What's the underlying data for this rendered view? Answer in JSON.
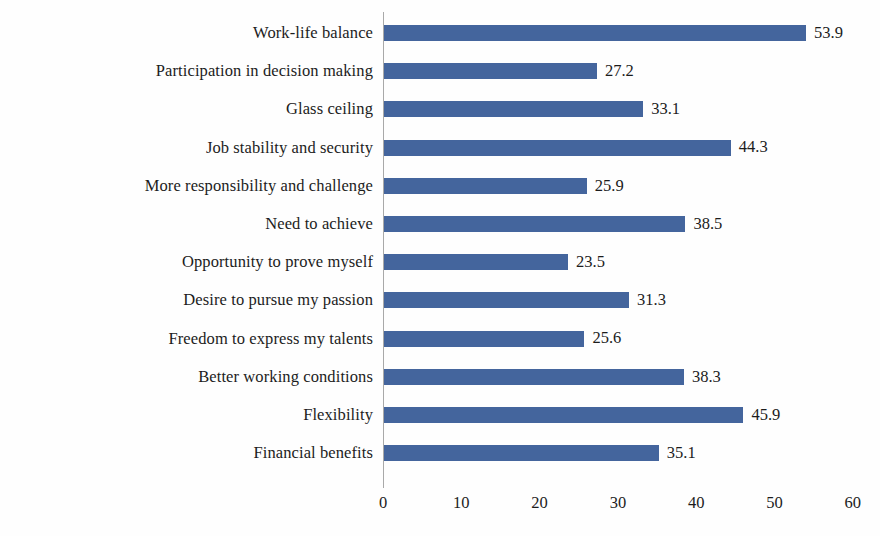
{
  "chart_data": {
    "type": "bar",
    "orientation": "horizontal",
    "title": "",
    "subtitle": "",
    "xlabel": "",
    "ylabel": "",
    "xlim": [
      0,
      60
    ],
    "xticks": [
      "0",
      "10",
      "20",
      "30",
      "40",
      "50",
      "60"
    ],
    "grid": false,
    "legend": false,
    "legend_position": "none",
    "bar_color": "#44659d",
    "axis_color": "#a9a9a9",
    "text_color": "#1c1c1c",
    "data_labels": true,
    "categories": [
      "Work-life balance",
      "Participation in decision making",
      "Glass ceiling",
      "Job stability and security",
      "More responsibility and challenge",
      "Need to achieve",
      "Opportunity to prove myself",
      "Desire to pursue my passion",
      "Freedom to express my talents",
      "Better working conditions",
      "Flexibility",
      "Financial benefits"
    ],
    "values": [
      53.9,
      27.2,
      33.1,
      44.3,
      25.9,
      38.5,
      23.5,
      31.3,
      25.6,
      38.3,
      45.9,
      35.1
    ],
    "value_labels": [
      "53.9",
      "27.2",
      "33.1",
      "44.3",
      "25.9",
      "38.5",
      "23.5",
      "31.3",
      "25.6",
      "38.3",
      "45.9",
      "35.1"
    ]
  }
}
